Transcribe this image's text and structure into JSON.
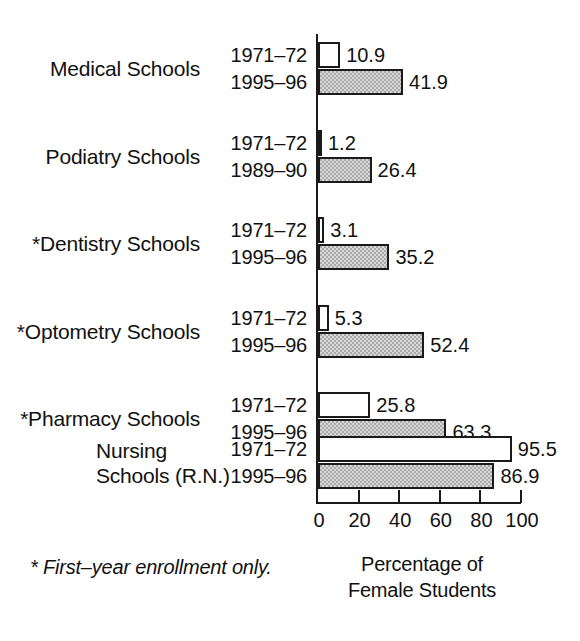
{
  "chart_data": {
    "type": "bar",
    "orientation": "horizontal",
    "title": "",
    "xlabel": "Percentage of Female Students",
    "xlabel_line1": "Percentage of",
    "xlabel_line2": "Female Students",
    "ylabel": "",
    "xlim": [
      0,
      100
    ],
    "xticks": [
      0,
      20,
      40,
      60,
      80,
      100
    ],
    "xtick_labels": [
      "0",
      "20",
      "40",
      "60",
      "80",
      "100"
    ],
    "grid": false,
    "legend": "none",
    "footnote": "* First–year enrollment only.",
    "categories": [
      "Medical Schools",
      "Podiatry Schools",
      "*Dentistry Schools",
      "*Optometry Schools",
      "*Pharmacy Schools",
      "Nursing Schools (R.N.)"
    ],
    "groups": [
      {
        "category": "Medical Schools",
        "category_line1": "Medical Schools",
        "category_line2": "",
        "bars": [
          {
            "period": "1971–72",
            "value": 10.9,
            "value_label": "10.9",
            "fill": "white"
          },
          {
            "period": "1995–96",
            "value": 41.9,
            "value_label": "41.9",
            "fill": "gray"
          }
        ]
      },
      {
        "category": "Podiatry Schools",
        "category_line1": "Podiatry Schools",
        "category_line2": "",
        "bars": [
          {
            "period": "1971–72",
            "value": 1.2,
            "value_label": "1.2",
            "fill": "white"
          },
          {
            "period": "1989–90",
            "value": 26.4,
            "value_label": "26.4",
            "fill": "gray"
          }
        ]
      },
      {
        "category": "*Dentistry Schools",
        "category_line1": "*Dentistry Schools",
        "category_line2": "",
        "bars": [
          {
            "period": "1971–72",
            "value": 3.1,
            "value_label": "3.1",
            "fill": "white"
          },
          {
            "period": "1995–96",
            "value": 35.2,
            "value_label": "35.2",
            "fill": "gray"
          }
        ]
      },
      {
        "category": "*Optometry Schools",
        "category_line1": "*Optometry Schools",
        "category_line2": "",
        "bars": [
          {
            "period": "1971–72",
            "value": 5.3,
            "value_label": "5.3",
            "fill": "white"
          },
          {
            "period": "1995–96",
            "value": 52.4,
            "value_label": "52.4",
            "fill": "gray"
          }
        ]
      },
      {
        "category": "*Pharmacy Schools",
        "category_line1": "*Pharmacy Schools",
        "category_line2": "",
        "bars": [
          {
            "period": "1971–72",
            "value": 25.8,
            "value_label": "25.8",
            "fill": "white"
          },
          {
            "period": "1995–96",
            "value": 63.3,
            "value_label": "63.3",
            "fill": "gray"
          }
        ]
      },
      {
        "category": "Nursing Schools (R.N.)",
        "category_line1": "Nursing",
        "category_line2": "Schools (R.N.)",
        "bars": [
          {
            "period": "1971–72",
            "value": 95.5,
            "value_label": "95.5",
            "fill": "white"
          },
          {
            "period": "1995–96",
            "value": 86.9,
            "value_label": "86.9",
            "fill": "gray"
          }
        ]
      }
    ],
    "series": [
      {
        "name": "1971–72",
        "values": [
          10.9,
          1.2,
          3.1,
          5.3,
          25.8,
          95.5
        ]
      },
      {
        "name": "later period",
        "periods": [
          "1995–96",
          "1989–90",
          "1995–96",
          "1995–96",
          "1995–96",
          "1995–96"
        ],
        "values": [
          41.9,
          26.4,
          35.2,
          52.4,
          63.3,
          86.9
        ]
      }
    ]
  },
  "colors": {
    "bar_outline": "#1a1a1a",
    "bar_fill_period_a": "#ffffff",
    "bar_fill_period_b": "#a9a9a9",
    "axis": "#1a1a1a",
    "text": "#111111",
    "background": "#ffffff"
  }
}
